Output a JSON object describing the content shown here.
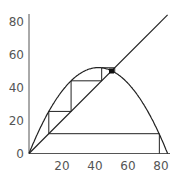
{
  "chart_data": {
    "type": "line",
    "title": "",
    "xlabel": "",
    "ylabel": "",
    "xlim": [
      0,
      85
    ],
    "ylim": [
      0,
      85
    ],
    "grid": false,
    "x_ticks": [
      "20",
      "40",
      "60",
      "80"
    ],
    "y_ticks": [
      "0",
      "20",
      "40",
      "60",
      "80"
    ],
    "series": [
      {
        "name": "logistic map f(x) = r·x·(1 − x/84)",
        "r": 2.48,
        "carrying_capacity": 84
      },
      {
        "name": "identity y = x"
      },
      {
        "name": "cobweb",
        "x0": 12,
        "fixed_point": [
          50,
          50
        ]
      }
    ]
  },
  "axes": {
    "y_labels": [
      "80",
      "60",
      "40",
      "20",
      "0"
    ],
    "x_labels": [
      "20",
      "40",
      "60",
      "80"
    ]
  }
}
